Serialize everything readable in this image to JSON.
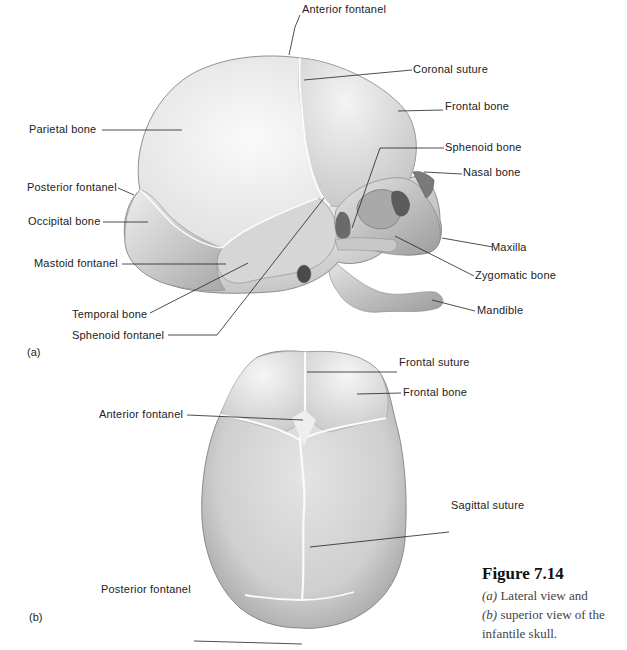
{
  "figure": {
    "number": "Figure 7.14",
    "caption_a_marker": "(a)",
    "caption_a_text": " Lateral view and",
    "caption_b_marker": "(b)",
    "caption_b_text": " superior view of the infantile skull."
  },
  "panel_a": {
    "marker": "(a)",
    "labels": [
      {
        "id": "anterior-fontanel",
        "text": "Anterior fontanel"
      },
      {
        "id": "coronal-suture",
        "text": "Coronal suture"
      },
      {
        "id": "frontal-bone",
        "text": "Frontal bone"
      },
      {
        "id": "parietal-bone",
        "text": "Parietal bone"
      },
      {
        "id": "sphenoid-bone",
        "text": "Sphenoid bone"
      },
      {
        "id": "nasal-bone",
        "text": "Nasal bone"
      },
      {
        "id": "posterior-fontanel",
        "text": "Posterior fontanel"
      },
      {
        "id": "occipital-bone",
        "text": "Occipital bone"
      },
      {
        "id": "maxilla",
        "text": "Maxilla"
      },
      {
        "id": "mastoid-fontanel",
        "text": "Mastoid fontanel"
      },
      {
        "id": "zygomatic-bone",
        "text": "Zygomatic bone"
      },
      {
        "id": "temporal-bone",
        "text": "Temporal bone"
      },
      {
        "id": "mandible",
        "text": "Mandible"
      },
      {
        "id": "sphenoid-fontanel",
        "text": "Sphenoid fontanel"
      }
    ]
  },
  "panel_b": {
    "marker": "(b)",
    "labels": [
      {
        "id": "frontal-suture",
        "text": "Frontal suture"
      },
      {
        "id": "frontal-bone",
        "text": "Frontal bone"
      },
      {
        "id": "anterior-fontanel",
        "text": "Anterior fontanel"
      },
      {
        "id": "sagittal-suture",
        "text": "Sagittal suture"
      },
      {
        "id": "posterior-fontanel",
        "text": "Posterior fontanel"
      }
    ]
  }
}
